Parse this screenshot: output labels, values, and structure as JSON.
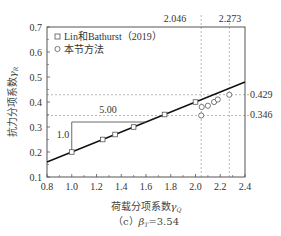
{
  "chart_data": {
    "type": "scatter",
    "title": "",
    "caption": "（c）β_T=3.54",
    "xlabel": "荷载分项系数γ_Q",
    "ylabel": "抗力分项系数γ_R",
    "xlim": [
      0.8,
      2.4
    ],
    "ylim": [
      0.1,
      0.7
    ],
    "xticks": [
      "0.8",
      "1.0",
      "1.2",
      "1.4",
      "1.6",
      "1.8",
      "2.0",
      "2.2",
      "2.4"
    ],
    "yticks": [
      "0.1",
      "0.2",
      "0.3",
      "0.4",
      "0.5",
      "0.6",
      "0.7"
    ],
    "legend": {
      "position": "upper left",
      "entries": [
        "Lin和Bathurst（2019）",
        "本节方法"
      ]
    },
    "series": [
      {
        "name": "Lin和Bathurst（2019）",
        "marker": "square",
        "x": [
          1.0,
          1.25,
          1.35,
          1.5,
          1.75,
          2.0
        ],
        "y": [
          0.2,
          0.25,
          0.27,
          0.3,
          0.35,
          0.4
        ]
      },
      {
        "name": "本节方法",
        "marker": "circle",
        "x": [
          2.046,
          2.05,
          2.1,
          2.15,
          2.18,
          2.273
        ],
        "y": [
          0.346,
          0.38,
          0.385,
          0.4,
          0.41,
          0.429
        ]
      },
      {
        "name": "fit line",
        "marker": "line",
        "x": [
          0.8,
          2.4
        ],
        "y": [
          0.16,
          0.48
        ]
      }
    ],
    "annotations": {
      "slope_run_label": "5.00",
      "slope_rise_label": "1.0",
      "vlines": [
        {
          "x": 2.046,
          "label": "2.046"
        },
        {
          "x": 2.273,
          "label": "2.273"
        }
      ],
      "hlines": [
        {
          "y": 0.429,
          "label": "0.429"
        },
        {
          "y": 0.346,
          "label": "0.346"
        }
      ]
    },
    "grid": false
  },
  "labels": {
    "xlabel_main": "荷载分项系数",
    "xlabel_sym": "γ",
    "xlabel_sub": "Q",
    "ylabel_main": "抗力分项系数",
    "ylabel_sym": "γ",
    "ylabel_sub": "R",
    "caption_prefix": "（c）",
    "caption_sym": "β",
    "caption_sub": "T",
    "caption_val": "=3.54",
    "legend_1": "Lin和Bathurst（2019）",
    "legend_2": "本节方法",
    "run": "5.00",
    "rise": "1.0",
    "v1": "2.046",
    "v2": "2.273",
    "h1": "0.429",
    "h2": "0.346"
  },
  "colors": {
    "axis": "#555555",
    "line": "#111111",
    "marker": "#555555",
    "dash": "#999999"
  }
}
